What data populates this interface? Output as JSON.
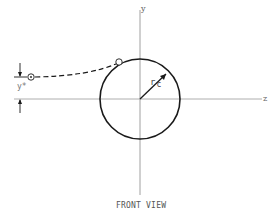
{
  "figure": {
    "caption": "FRONT VIEW",
    "axes": {
      "vertical_label": "y",
      "horizontal_label": "z"
    },
    "collector": {
      "radius_label_main": "r",
      "radius_label_sub": "c"
    },
    "offset": {
      "label": "y*"
    },
    "colors": {
      "stroke": "#1a1a1a",
      "axis": "#888888",
      "text": "#555555"
    }
  }
}
